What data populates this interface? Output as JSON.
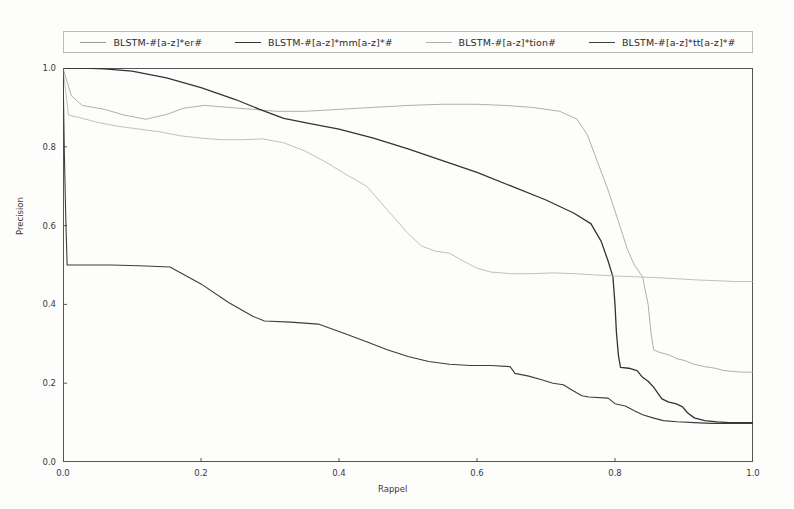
{
  "legend": {
    "position": "upper-center-outside",
    "entries": [
      {
        "label": "BLSTM-#[a-z]*er#",
        "color": "#9a9a9a",
        "width": 0.8,
        "style": "solid"
      },
      {
        "label": "BLSTM-#[a-z]*mm[a-z]*#",
        "color": "#333333",
        "width": 1.3,
        "style": "solid"
      },
      {
        "label": "BLSTM-#[a-z]*tion#",
        "color": "#b0b0b0",
        "width": 0.8,
        "style": "solid"
      },
      {
        "label": "BLSTM-#[a-z]*tt[a-z]*#",
        "color": "#3d3d3d",
        "width": 1.1,
        "style": "solid"
      }
    ]
  },
  "axes": {
    "xlabel": "Rappel",
    "ylabel": "Precision",
    "xticks": [
      "0.0",
      "0.2",
      "0.4",
      "0.6",
      "0.8",
      "1.0"
    ],
    "ytickvals": [
      "0.0",
      "0.2",
      "0.4",
      "0.6",
      "0.8",
      "1.0"
    ],
    "xlim": [
      0.0,
      1.0
    ],
    "ylim": [
      0.0,
      1.0
    ],
    "grid": false,
    "frame_color": "#555555"
  },
  "chart_data": {
    "type": "line",
    "title": "",
    "xlabel": "Rappel",
    "ylabel": "Precision",
    "xlim": [
      0.0,
      1.0
    ],
    "ylim": [
      0.0,
      1.0
    ],
    "grid": false,
    "legend_position": "upper-center-outside",
    "series": [
      {
        "name": "BLSTM-#[a-z]*er#",
        "color": "#9a9a9a",
        "points": [
          [
            0.0,
            1.0
          ],
          [
            0.012,
            0.93
          ],
          [
            0.028,
            0.905
          ],
          [
            0.06,
            0.895
          ],
          [
            0.09,
            0.88
          ],
          [
            0.12,
            0.87
          ],
          [
            0.15,
            0.882
          ],
          [
            0.175,
            0.898
          ],
          [
            0.205,
            0.905
          ],
          [
            0.24,
            0.9
          ],
          [
            0.275,
            0.895
          ],
          [
            0.31,
            0.89
          ],
          [
            0.35,
            0.89
          ],
          [
            0.4,
            0.895
          ],
          [
            0.45,
            0.9
          ],
          [
            0.5,
            0.905
          ],
          [
            0.55,
            0.908
          ],
          [
            0.6,
            0.908
          ],
          [
            0.64,
            0.905
          ],
          [
            0.68,
            0.9
          ],
          [
            0.72,
            0.89
          ],
          [
            0.745,
            0.87
          ],
          [
            0.76,
            0.83
          ],
          [
            0.775,
            0.76
          ],
          [
            0.79,
            0.69
          ],
          [
            0.805,
            0.61
          ],
          [
            0.818,
            0.54
          ],
          [
            0.828,
            0.5
          ],
          [
            0.84,
            0.47
          ],
          [
            0.848,
            0.4
          ],
          [
            0.852,
            0.33
          ],
          [
            0.856,
            0.285
          ],
          [
            0.865,
            0.278
          ],
          [
            0.878,
            0.272
          ],
          [
            0.89,
            0.262
          ],
          [
            0.9,
            0.258
          ],
          [
            0.915,
            0.248
          ],
          [
            0.93,
            0.242
          ],
          [
            0.945,
            0.238
          ],
          [
            0.958,
            0.232
          ],
          [
            0.97,
            0.23
          ],
          [
            0.985,
            0.228
          ],
          [
            1.0,
            0.228
          ]
        ]
      },
      {
        "name": "BLSTM-#[a-z]*mm[a-z]*#",
        "color": "#333333",
        "points": [
          [
            0.0,
            1.0
          ],
          [
            0.03,
            1.0
          ],
          [
            0.06,
            0.998
          ],
          [
            0.1,
            0.992
          ],
          [
            0.15,
            0.975
          ],
          [
            0.2,
            0.95
          ],
          [
            0.25,
            0.92
          ],
          [
            0.285,
            0.895
          ],
          [
            0.32,
            0.872
          ],
          [
            0.36,
            0.858
          ],
          [
            0.4,
            0.845
          ],
          [
            0.45,
            0.822
          ],
          [
            0.5,
            0.795
          ],
          [
            0.55,
            0.765
          ],
          [
            0.6,
            0.735
          ],
          [
            0.65,
            0.7
          ],
          [
            0.7,
            0.665
          ],
          [
            0.74,
            0.632
          ],
          [
            0.765,
            0.605
          ],
          [
            0.78,
            0.56
          ],
          [
            0.79,
            0.51
          ],
          [
            0.797,
            0.47
          ],
          [
            0.8,
            0.4
          ],
          [
            0.802,
            0.33
          ],
          [
            0.805,
            0.27
          ],
          [
            0.808,
            0.24
          ],
          [
            0.82,
            0.238
          ],
          [
            0.832,
            0.232
          ],
          [
            0.84,
            0.215
          ],
          [
            0.848,
            0.205
          ],
          [
            0.856,
            0.19
          ],
          [
            0.862,
            0.175
          ],
          [
            0.868,
            0.16
          ],
          [
            0.878,
            0.152
          ],
          [
            0.888,
            0.148
          ],
          [
            0.898,
            0.14
          ],
          [
            0.905,
            0.125
          ],
          [
            0.915,
            0.112
          ],
          [
            0.93,
            0.105
          ],
          [
            0.948,
            0.102
          ],
          [
            0.965,
            0.1
          ],
          [
            0.982,
            0.1
          ],
          [
            1.0,
            0.1
          ]
        ]
      },
      {
        "name": "BLSTM-#[a-z]*tion#",
        "color": "#b0b0b0",
        "points": [
          [
            0.0,
            1.0
          ],
          [
            0.008,
            0.88
          ],
          [
            0.022,
            0.875
          ],
          [
            0.05,
            0.862
          ],
          [
            0.08,
            0.852
          ],
          [
            0.11,
            0.845
          ],
          [
            0.14,
            0.838
          ],
          [
            0.17,
            0.828
          ],
          [
            0.2,
            0.822
          ],
          [
            0.23,
            0.818
          ],
          [
            0.26,
            0.818
          ],
          [
            0.29,
            0.82
          ],
          [
            0.32,
            0.81
          ],
          [
            0.35,
            0.79
          ],
          [
            0.38,
            0.762
          ],
          [
            0.41,
            0.73
          ],
          [
            0.44,
            0.7
          ],
          [
            0.46,
            0.66
          ],
          [
            0.48,
            0.62
          ],
          [
            0.5,
            0.58
          ],
          [
            0.52,
            0.548
          ],
          [
            0.54,
            0.535
          ],
          [
            0.56,
            0.53
          ],
          [
            0.58,
            0.51
          ],
          [
            0.6,
            0.492
          ],
          [
            0.62,
            0.482
          ],
          [
            0.65,
            0.478
          ],
          [
            0.68,
            0.478
          ],
          [
            0.71,
            0.48
          ],
          [
            0.74,
            0.478
          ],
          [
            0.77,
            0.475
          ],
          [
            0.8,
            0.472
          ],
          [
            0.83,
            0.47
          ],
          [
            0.86,
            0.468
          ],
          [
            0.89,
            0.465
          ],
          [
            0.92,
            0.462
          ],
          [
            0.95,
            0.46
          ],
          [
            0.975,
            0.458
          ],
          [
            1.0,
            0.458
          ]
        ]
      },
      {
        "name": "BLSTM-#[a-z]*tt[a-z]*#",
        "color": "#3d3d3d",
        "points": [
          [
            0.0,
            1.0
          ],
          [
            0.002,
            0.78
          ],
          [
            0.004,
            0.62
          ],
          [
            0.006,
            0.5
          ],
          [
            0.03,
            0.5
          ],
          [
            0.07,
            0.5
          ],
          [
            0.11,
            0.498
          ],
          [
            0.155,
            0.495
          ],
          [
            0.2,
            0.452
          ],
          [
            0.24,
            0.405
          ],
          [
            0.275,
            0.37
          ],
          [
            0.292,
            0.358
          ],
          [
            0.33,
            0.355
          ],
          [
            0.37,
            0.35
          ],
          [
            0.41,
            0.325
          ],
          [
            0.44,
            0.305
          ],
          [
            0.47,
            0.285
          ],
          [
            0.5,
            0.268
          ],
          [
            0.53,
            0.255
          ],
          [
            0.56,
            0.248
          ],
          [
            0.59,
            0.245
          ],
          [
            0.62,
            0.245
          ],
          [
            0.648,
            0.242
          ],
          [
            0.655,
            0.225
          ],
          [
            0.675,
            0.218
          ],
          [
            0.695,
            0.208
          ],
          [
            0.71,
            0.2
          ],
          [
            0.725,
            0.196
          ],
          [
            0.74,
            0.18
          ],
          [
            0.752,
            0.168
          ],
          [
            0.762,
            0.165
          ],
          [
            0.79,
            0.162
          ],
          [
            0.8,
            0.148
          ],
          [
            0.815,
            0.142
          ],
          [
            0.828,
            0.13
          ],
          [
            0.84,
            0.12
          ],
          [
            0.855,
            0.112
          ],
          [
            0.87,
            0.105
          ],
          [
            0.89,
            0.102
          ],
          [
            0.915,
            0.1
          ],
          [
            0.94,
            0.098
          ],
          [
            0.965,
            0.098
          ],
          [
            1.0,
            0.098
          ]
        ]
      }
    ]
  }
}
